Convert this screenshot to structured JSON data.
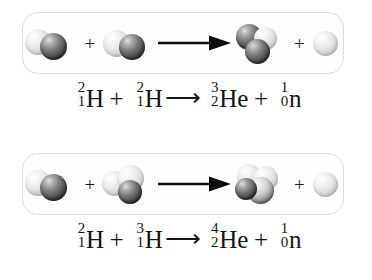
{
  "figure": {
    "background_color": "#ffffff",
    "box_border_color": "#dcdcdc",
    "sphere_light_color": "#e9e9e9",
    "sphere_dark_color": "#3a3a3a",
    "arrow_color": "#0d0d0d"
  },
  "reactions": [
    {
      "id": "deuterium-deuterium-fusion",
      "diagram": {
        "reactants": [
          {
            "name": "deuterium-nucleus",
            "label": "deuterium",
            "spheres": [
              {
                "type": "light",
                "role": "proton"
              },
              {
                "type": "dark",
                "role": "neutron"
              }
            ]
          },
          {
            "name": "deuterium-nucleus",
            "label": "deuterium",
            "spheres": [
              {
                "type": "light",
                "role": "proton"
              },
              {
                "type": "dark",
                "role": "neutron"
              }
            ]
          }
        ],
        "products": [
          {
            "name": "helium-3-nucleus",
            "label": "helium-3",
            "spheres": [
              {
                "type": "dark",
                "role": "proton"
              },
              {
                "type": "light",
                "role": "proton"
              },
              {
                "type": "dark",
                "role": "neutron"
              }
            ]
          },
          {
            "name": "neutron-particle",
            "label": "neutron",
            "spheres": [
              {
                "type": "light",
                "role": "neutron"
              }
            ]
          }
        ],
        "plus_symbol": "+",
        "arrow_symbol": "⟶"
      },
      "equation": {
        "terms": [
          {
            "sup": "2",
            "sub": "1",
            "symbol": "H"
          },
          {
            "op": "+"
          },
          {
            "sup": "2",
            "sub": "1",
            "symbol": "H"
          },
          {
            "arrow": "⟶"
          },
          {
            "sup": "3",
            "sub": "2",
            "symbol": "He"
          },
          {
            "op": "+"
          },
          {
            "sup": "1",
            "sub": "0",
            "symbol": "n"
          }
        ],
        "plain_text": "2/1 H + 2/1 H ⟶ 3/2 He + 1/0 n"
      }
    },
    {
      "id": "deuterium-tritium-fusion",
      "diagram": {
        "reactants": [
          {
            "name": "deuterium-nucleus",
            "label": "deuterium",
            "spheres": [
              {
                "type": "light",
                "role": "proton"
              },
              {
                "type": "dark",
                "role": "neutron"
              }
            ]
          },
          {
            "name": "tritium-nucleus",
            "label": "tritium",
            "spheres": [
              {
                "type": "light",
                "role": "proton"
              },
              {
                "type": "light",
                "role": "neutron"
              },
              {
                "type": "dark",
                "role": "neutron"
              }
            ]
          }
        ],
        "products": [
          {
            "name": "helium-4-nucleus",
            "label": "helium-4",
            "spheres": [
              {
                "type": "light",
                "role": "proton"
              },
              {
                "type": "light",
                "role": "proton"
              },
              {
                "type": "mid",
                "role": "neutron"
              },
              {
                "type": "dark",
                "role": "neutron"
              }
            ]
          },
          {
            "name": "neutron-particle",
            "label": "neutron",
            "spheres": [
              {
                "type": "light",
                "role": "neutron"
              }
            ]
          }
        ],
        "plus_symbol": "+",
        "arrow_symbol": "⟶"
      },
      "equation": {
        "terms": [
          {
            "sup": "2",
            "sub": "1",
            "symbol": "H"
          },
          {
            "op": "+"
          },
          {
            "sup": "3",
            "sub": "1",
            "symbol": "H"
          },
          {
            "arrow": "⟶"
          },
          {
            "sup": "4",
            "sub": "2",
            "symbol": "He"
          },
          {
            "op": "+"
          },
          {
            "sup": "1",
            "sub": "0",
            "symbol": "n"
          }
        ],
        "plain_text": "2/1 H + 3/1 H ⟶ 4/2 He + 1/0 n"
      }
    }
  ]
}
